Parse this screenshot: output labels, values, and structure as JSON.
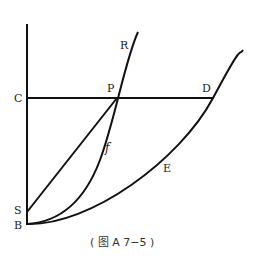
{
  "diagram": {
    "labels": {
      "R": "R",
      "C": "C",
      "P": "P",
      "D": "D",
      "f": "f",
      "E": "E",
      "S": "S",
      "B": "B"
    },
    "caption": "( 图 A 7−5 )",
    "line_color": "#111111"
  }
}
